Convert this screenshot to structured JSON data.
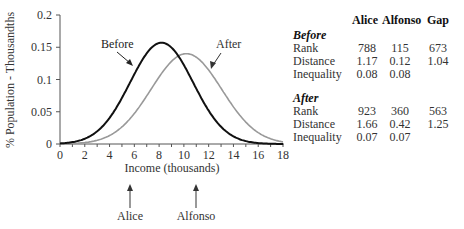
{
  "chart_data": {
    "type": "line",
    "title": "",
    "xlabel": "Income (thousands)",
    "ylabel": "% Population - Thousandths",
    "xlim": [
      0,
      18
    ],
    "ylim": [
      0,
      0.2
    ],
    "x_ticks": [
      "0",
      "2",
      "4",
      "6",
      "8",
      "10",
      "12",
      "14",
      "16",
      "18"
    ],
    "y_ticks": [
      "0",
      "0.05",
      "0.1",
      "0.15",
      "0.2"
    ],
    "grid": false,
    "series": [
      {
        "name": "Before",
        "mean": 8.2,
        "sd": 2.55,
        "peak": 0.157,
        "color": "#111111"
      },
      {
        "name": "After",
        "mean": 10.2,
        "sd": 2.85,
        "peak": 0.14,
        "color": "#999999"
      }
    ],
    "annotations": [
      {
        "text": "Before",
        "points_to": "Before curve"
      },
      {
        "text": "After",
        "points_to": "After curve"
      },
      {
        "text": "Alice",
        "x": 5.6,
        "arrow": "up"
      },
      {
        "text": "Alfonso",
        "x": 11.0,
        "arrow": "up"
      }
    ]
  },
  "labels": {
    "before_curve": "Before",
    "after_curve": "After",
    "alice": "Alice",
    "alfonso": "Alfonso",
    "xlabel": "Income (thousands)",
    "ylabel": "% Population - Thousandths"
  },
  "table": {
    "headers": [
      "Alice",
      "Alfonso",
      "Gap"
    ],
    "sections": [
      {
        "title": "Before",
        "rows": [
          {
            "label": "Rank",
            "alice": "788",
            "alfonso": "115",
            "gap": "673"
          },
          {
            "label": "Distance",
            "alice": "1.17",
            "alfonso": "0.12",
            "gap": "1.04"
          },
          {
            "label": "Inequality",
            "alice": "0.08",
            "alfonso": "0.08",
            "gap": ""
          }
        ]
      },
      {
        "title": "After",
        "rows": [
          {
            "label": "Rank",
            "alice": "923",
            "alfonso": "360",
            "gap": "563"
          },
          {
            "label": "Distance",
            "alice": "1.66",
            "alfonso": "0.42",
            "gap": "1.25"
          },
          {
            "label": "Inequality",
            "alice": "0.07",
            "alfonso": "0.07",
            "gap": ""
          }
        ]
      }
    ]
  }
}
